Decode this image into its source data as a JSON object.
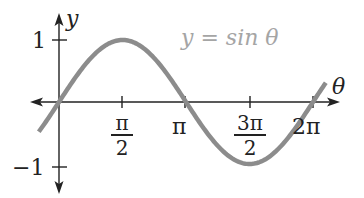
{
  "chart_data": {
    "type": "line",
    "title": "y = sin θ",
    "xlabel": "θ",
    "ylabel": "y",
    "x_ticks": [
      {
        "value": 1.5708,
        "label": "π/2",
        "num": "π",
        "den": "2"
      },
      {
        "value": 3.1416,
        "label": "π"
      },
      {
        "value": 4.7124,
        "label": "3π/2",
        "num": "3π",
        "den": "2"
      },
      {
        "value": 6.2832,
        "label": "2π"
      }
    ],
    "y_ticks": [
      {
        "value": 1,
        "label": "1"
      },
      {
        "value": -1,
        "label": "−1"
      }
    ],
    "xlim": [
      -0.5,
      6.6
    ],
    "ylim": [
      -1,
      1
    ],
    "grid": false,
    "legend": "none",
    "series": [
      {
        "name": "y = sin θ",
        "function": "sin",
        "x": [
          -0.5,
          0,
          0.7854,
          1.5708,
          2.3562,
          3.1416,
          3.927,
          4.7124,
          5.4978,
          6.2832,
          6.6
        ],
        "values": [
          -0.479,
          0,
          0.707,
          1,
          0.707,
          0,
          -0.707,
          -1,
          -0.707,
          0,
          0.312
        ],
        "color": "#8c8c8c"
      }
    ]
  },
  "labels": {
    "title": "y = sin θ",
    "y_axis": "y",
    "x_axis": "θ",
    "y_pos": "1",
    "y_neg": "−1",
    "pi_half_num": "π",
    "pi_half_den": "2",
    "pi": "π",
    "three_pi_half_num": "3π",
    "three_pi_half_den": "2",
    "two_pi": "2π"
  },
  "colors": {
    "curve": "#8c8c8c",
    "axis": "#222222",
    "title": "#a5a5a5"
  }
}
